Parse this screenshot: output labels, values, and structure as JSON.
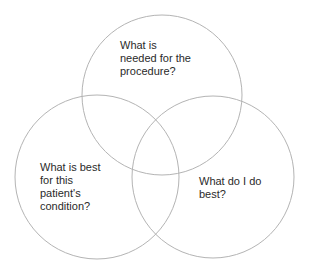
{
  "diagram": {
    "type": "venn",
    "circles": [
      {
        "id": "top",
        "label": "What is\nneeded for the\nprocedure?",
        "cx": 162,
        "cy": 95,
        "r": 80
      },
      {
        "id": "left",
        "label": "What is best\nfor this\npatient's\ncondition?",
        "cx": 97,
        "cy": 177,
        "r": 82
      },
      {
        "id": "right",
        "label": "What do I do\nbest?",
        "cx": 213,
        "cy": 177,
        "r": 81
      }
    ],
    "stroke_color": "#b4b4b4",
    "text_color": "#2a2a2a",
    "background": "#ffffff"
  }
}
